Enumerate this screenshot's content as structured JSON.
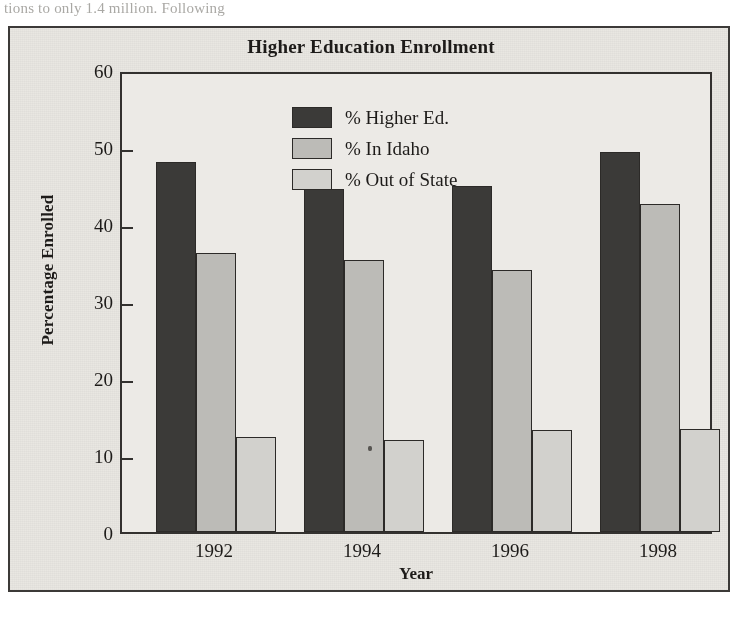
{
  "page": {
    "bleed_text": "tions to only 1.4 million. Following"
  },
  "chart_data": {
    "type": "bar",
    "title": "Higher Education Enrollment",
    "xlabel": "Year",
    "ylabel": "Percentage Enrolled",
    "categories": [
      "1992",
      "1994",
      "1996",
      "1998"
    ],
    "series": [
      {
        "name": "% Higher Ed.",
        "color": "#3b3a38",
        "values": [
          48.1,
          44.6,
          45.0,
          49.4
        ]
      },
      {
        "name": "% In Idaho",
        "color": "#bcbbb7",
        "values": [
          36.2,
          35.3,
          34.0,
          42.6
        ]
      },
      {
        "name": "% Out of State",
        "color": "#d2d1cd",
        "values": [
          12.4,
          12.0,
          13.3,
          13.4
        ]
      }
    ],
    "ylim": [
      0,
      60
    ],
    "yticks": [
      "0",
      "10",
      "20",
      "30",
      "40",
      "50",
      "60"
    ],
    "ytick_values": [
      0,
      10,
      20,
      30,
      40,
      50,
      60
    ],
    "grid": false,
    "legend_position": "top-center-inside"
  }
}
